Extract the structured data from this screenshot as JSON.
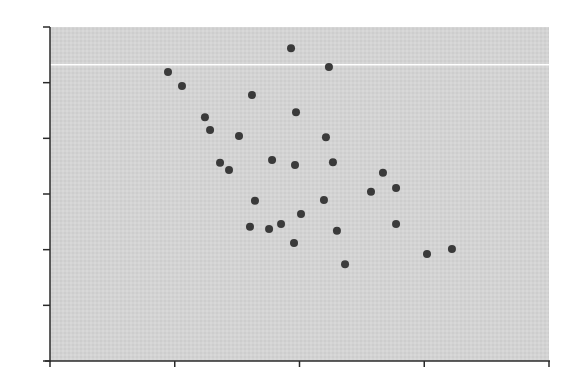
{
  "chart_data": {
    "type": "scatter",
    "title": "",
    "xlabel": "",
    "ylabel": "",
    "xlim": [
      0,
      4
    ],
    "ylim": [
      0,
      6
    ],
    "x_ticks": [
      0,
      1,
      2,
      3,
      4
    ],
    "y_ticks": [
      0,
      1,
      2,
      3,
      4,
      5,
      6
    ],
    "x_tick_labels": [],
    "y_tick_labels": [],
    "grid": false,
    "legend": null,
    "reference_lines": [
      {
        "orientation": "horizontal",
        "y": 5.32,
        "color": "#ffffff"
      }
    ],
    "colors": {
      "plot_background": "#d3d3d3",
      "marker": "#3a3a3a",
      "axis": "#2a2a2a"
    },
    "series": [
      {
        "name": "points",
        "points": [
          [
            0.946,
            5.19
          ],
          [
            1.058,
            4.94
          ],
          [
            1.242,
            4.38
          ],
          [
            1.283,
            4.15
          ],
          [
            1.515,
            4.04
          ],
          [
            1.363,
            3.56
          ],
          [
            1.435,
            3.43
          ],
          [
            1.619,
            4.78
          ],
          [
            1.932,
            5.62
          ],
          [
            2.236,
            5.28
          ],
          [
            1.972,
            4.47
          ],
          [
            2.212,
            4.02
          ],
          [
            1.78,
            3.61
          ],
          [
            1.964,
            3.52
          ],
          [
            2.268,
            3.57
          ],
          [
            1.643,
            2.88
          ],
          [
            2.196,
            2.89
          ],
          [
            2.012,
            2.64
          ],
          [
            1.603,
            2.41
          ],
          [
            1.756,
            2.37
          ],
          [
            1.852,
            2.46
          ],
          [
            2.3,
            2.34
          ],
          [
            1.956,
            2.12
          ],
          [
            2.365,
            1.74
          ],
          [
            2.669,
            3.38
          ],
          [
            2.573,
            3.04
          ],
          [
            2.774,
            3.11
          ],
          [
            2.774,
            2.46
          ],
          [
            3.022,
            1.92
          ],
          [
            3.222,
            2.01
          ]
        ]
      }
    ]
  },
  "layout": {
    "plot": {
      "left": 50,
      "top": 27,
      "right": 549,
      "bottom": 361
    },
    "marker_radius": 4
  }
}
